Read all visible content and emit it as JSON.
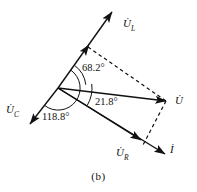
{
  "figure": {
    "caption": "(b)",
    "type": "phasor-diagram",
    "background_color": "#ffffff",
    "stroke_color": "#111111"
  },
  "vectors": [
    {
      "id": "u-l",
      "name": "U_L",
      "label_main": "U",
      "label_sub": "L",
      "label_x": 123,
      "label_y": 18,
      "from": [
        58,
        88
      ],
      "to": [
        112,
        12
      ],
      "style": "solid",
      "arrow": "end",
      "mid_arrow": [
        86,
        49
      ]
    },
    {
      "id": "u-c",
      "name": "U_C",
      "label_main": "U",
      "label_sub": "C",
      "label_x": 6,
      "label_y": 104,
      "from": [
        58,
        88
      ],
      "to": [
        30,
        124
      ],
      "style": "solid",
      "arrow": "end",
      "mid_arrow": null
    },
    {
      "id": "u",
      "name": "U",
      "label_main": "U",
      "label_sub": "",
      "label_x": 175,
      "label_y": 95,
      "from": [
        58,
        88
      ],
      "to": [
        166,
        101
      ],
      "style": "solid",
      "arrow": "end",
      "mid_arrow": null
    },
    {
      "id": "u-r",
      "name": "U_R",
      "label_main": "U",
      "label_sub": "R",
      "label_x": 116,
      "label_y": 147,
      "from": [
        58,
        88
      ],
      "to": [
        141,
        140
      ],
      "style": "solid",
      "arrow": "end",
      "mid_arrow": null
    },
    {
      "id": "i",
      "name": "I",
      "label_main": "I",
      "label_sub": "",
      "label_x": 170,
      "label_y": 144,
      "from": [
        58,
        88
      ],
      "to": [
        165,
        154
      ],
      "style": "solid",
      "arrow": "end",
      "mid_arrow": null
    }
  ],
  "dashed_lines": [
    {
      "id": "dash-ul-u",
      "from": [
        88,
        47
      ],
      "to": [
        166,
        101
      ]
    },
    {
      "id": "dash-u-ur",
      "from": [
        166,
        101
      ],
      "to": [
        143,
        145
      ]
    }
  ],
  "angles": [
    {
      "id": "angle-68",
      "text": "68.2°",
      "label_x": 82,
      "label_y": 63,
      "arc": {
        "cx": 58,
        "cy": 88,
        "r": 28,
        "start_deg": -54.6,
        "end_deg": -6.8
      }
    },
    {
      "id": "angle-21",
      "text": "21.8°",
      "label_x": 95,
      "label_y": 97,
      "arc": {
        "cx": 58,
        "cy": 88,
        "r": 34,
        "start_deg": -6.8,
        "end_deg": 30.4
      }
    },
    {
      "id": "angle-118",
      "text": "118.8°",
      "label_x": 42,
      "label_y": 112,
      "arc": {
        "cx": 58,
        "cy": 88,
        "r": 22,
        "start_deg": -54.6,
        "end_deg": 127.9
      }
    }
  ],
  "chart_data": {
    "type": "scatter",
    "title": "(b)",
    "xlabel": "",
    "ylabel": "",
    "origin": [
      58,
      88
    ],
    "phasors": [
      {
        "name": "U_L",
        "angle_deg": 54.6,
        "direction": "up-right"
      },
      {
        "name": "U_C",
        "angle_deg": -127.9,
        "direction": "down-left"
      },
      {
        "name": "U",
        "angle_deg": -6.8,
        "direction": "right"
      },
      {
        "name": "U_R",
        "angle_deg": -30.4,
        "direction": "down-right"
      },
      {
        "name": "I",
        "angle_deg": -31.7,
        "direction": "down-right"
      }
    ],
    "annotations": [
      "68.2°",
      "21.8°",
      "118.8°"
    ],
    "angle_values": [
      68.2,
      21.8,
      118.8
    ]
  }
}
